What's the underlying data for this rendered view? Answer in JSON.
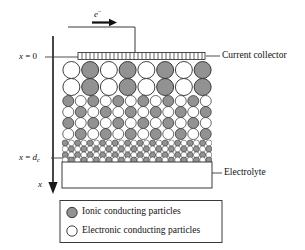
{
  "figure": {
    "colors": {
      "ionic_particle_fill": "#929292",
      "electronic_particle_fill": "#ffffff",
      "particle_stroke": "#2b2b2b",
      "line": "#2b2b2b",
      "background": "#ffffff"
    }
  },
  "annotations": {
    "electron_label": "e",
    "electron_superscript": "−",
    "x_zero_label": "x = 0",
    "x_zero_var": "x",
    "x_zero_eq": " = 0",
    "x_dc_var": "x",
    "x_dc_eq": " = ",
    "x_dc_d": "d",
    "x_dc_sub": "c",
    "axis_label": "x",
    "current_collector_label": "Current collector",
    "electrolyte_label": "Electrolyte"
  },
  "legend": {
    "items": [
      {
        "marker": "ionic-particle-marker",
        "fill": "#929292",
        "label": "Ionic conducting particles"
      },
      {
        "marker": "electronic-particle-marker",
        "fill": "#ffffff",
        "label": "Electronic conducting particles"
      }
    ]
  },
  "chart_data": {
    "type": "diagram",
    "axes": {
      "x_axis": {
        "orientation": "vertical-down",
        "label": "x",
        "ticks": [
          "x = 0",
          "x = d_c"
        ],
        "tick_pixel_y": [
          57,
          158
        ]
      }
    },
    "regions": [
      {
        "name": "current-collector",
        "x_range": [
          78,
          205
        ],
        "y_range": [
          53,
          60
        ]
      },
      {
        "name": "electrode-bed",
        "x_range": [
          62,
          212
        ],
        "y_range": [
          60,
          162
        ]
      },
      {
        "name": "electrolyte",
        "x_range": [
          62,
          212
        ],
        "y_range": [
          162,
          188
        ]
      }
    ],
    "particle_layers": [
      {
        "row": 1,
        "diameter": 17,
        "center_y": 70,
        "pattern": [
          "electronic",
          "ionic",
          "electronic",
          "ionic",
          "electronic",
          "ionic",
          "electronic",
          "ionic"
        ]
      },
      {
        "row": 2,
        "diameter": 17,
        "center_y": 87,
        "pattern": [
          "electronic",
          "ionic",
          "electronic",
          "ionic",
          "electronic",
          "ionic",
          "electronic",
          "ionic"
        ]
      },
      {
        "row": 3,
        "diameter": 11,
        "center_y": 101,
        "pattern": [
          "ionic",
          "electronic",
          "ionic",
          "electronic",
          "ionic",
          "electronic",
          "ionic",
          "electronic",
          "ionic",
          "electronic",
          "ionic",
          "electronic"
        ]
      },
      {
        "row": 4,
        "diameter": 11,
        "center_y": 112,
        "pattern": [
          "electronic",
          "ionic",
          "electronic",
          "ionic",
          "electronic",
          "ionic",
          "electronic",
          "ionic",
          "electronic",
          "ionic",
          "electronic",
          "ionic"
        ]
      },
      {
        "row": 5,
        "diameter": 11,
        "center_y": 123,
        "pattern": [
          "ionic",
          "electronic",
          "ionic",
          "electronic",
          "ionic",
          "electronic",
          "ionic",
          "electronic",
          "ionic",
          "electronic",
          "ionic",
          "electronic"
        ]
      },
      {
        "row": 6,
        "diameter": 11,
        "center_y": 134,
        "pattern": [
          "electronic",
          "ionic",
          "electronic",
          "ionic",
          "electronic",
          "ionic",
          "electronic",
          "ionic",
          "electronic",
          "ionic",
          "electronic",
          "ionic"
        ]
      },
      {
        "row": 7,
        "diameter": 6,
        "center_y": 143,
        "pattern": [
          "ionic",
          "electronic",
          "ionic",
          "electronic",
          "ionic",
          "electronic",
          "ionic",
          "electronic",
          "ionic",
          "electronic",
          "ionic",
          "electronic",
          "ionic",
          "electronic",
          "ionic",
          "electronic",
          "ionic",
          "electronic",
          "ionic",
          "electronic",
          "ionic",
          "electronic",
          "ionic",
          "electronic"
        ]
      },
      {
        "row": 8,
        "diameter": 6,
        "center_y": 149,
        "pattern": [
          "electronic",
          "ionic",
          "electronic",
          "ionic",
          "electronic",
          "ionic",
          "electronic",
          "ionic",
          "electronic",
          "ionic",
          "electronic",
          "ionic",
          "electronic",
          "ionic",
          "electronic",
          "ionic",
          "electronic",
          "ionic",
          "electronic",
          "ionic",
          "electronic",
          "ionic",
          "electronic",
          "ionic"
        ]
      },
      {
        "row": 9,
        "diameter": 6,
        "center_y": 155,
        "pattern": [
          "ionic",
          "electronic",
          "ionic",
          "electronic",
          "ionic",
          "electronic",
          "ionic",
          "electronic",
          "ionic",
          "electronic",
          "ionic",
          "electronic",
          "ionic",
          "electronic",
          "ionic",
          "electronic",
          "ionic",
          "electronic",
          "ionic",
          "electronic",
          "ionic",
          "electronic",
          "ionic",
          "electronic"
        ]
      },
      {
        "row": 10,
        "diameter": 6,
        "center_y": 160,
        "pattern": [
          "electronic",
          "ionic",
          "electronic",
          "ionic",
          "electronic",
          "ionic",
          "electronic",
          "ionic",
          "electronic",
          "ionic",
          "electronic",
          "ionic",
          "electronic",
          "ionic",
          "electronic",
          "ionic",
          "electronic",
          "ionic",
          "electronic",
          "ionic",
          "electronic",
          "ionic",
          "electronic",
          "ionic"
        ]
      }
    ]
  }
}
